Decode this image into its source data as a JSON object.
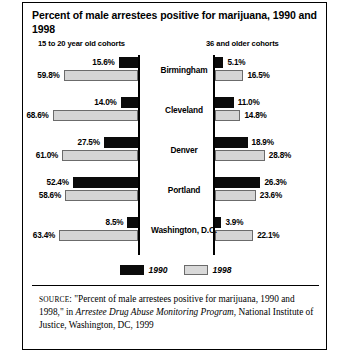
{
  "figure": {
    "title": "Percent of male arrestees positive for marijuana, 1990 and 1998",
    "left_header": "15 to 20 year old cohorts",
    "right_header": "36 and older cohorts",
    "legend": [
      {
        "label": "1990",
        "color": "#0b0b0b"
      },
      {
        "label": "1998",
        "color": "#d5d5d5"
      }
    ],
    "source_prefix": "SOURCE",
    "source_part1": ": \"Percent of male arrestees positive for marijuana, 1990 and 1998,\" in ",
    "source_italic": "Arrestee Drug Abuse Monitoring Program",
    "source_part2": ", National Institute of Justice, Washington, DC, 1999"
  },
  "chart_data": {
    "type": "bar",
    "title": "Percent of male arrestees positive for marijuana, 1990 and 1998",
    "orientation": "horizontal",
    "panels": [
      {
        "name": "15 to 20 year old cohorts",
        "direction": "left",
        "max": 70,
        "series": [
          {
            "name": "1990",
            "values": [
              15.6,
              14.0,
              27.5,
              52.4,
              8.5
            ]
          },
          {
            "name": "1998",
            "values": [
              59.8,
              68.6,
              61.0,
              58.6,
              63.4
            ]
          }
        ],
        "labels": {
          "1990": [
            "15.6%",
            "14.0%",
            "27.5%",
            "52.4%",
            "8.5%"
          ],
          "1998": [
            "59.8%",
            "68.6%",
            "61.0%",
            "58.6%",
            "63.4%"
          ]
        }
      },
      {
        "name": "36 and older cohorts",
        "direction": "right",
        "max": 70,
        "series": [
          {
            "name": "1990",
            "values": [
              5.1,
              11.0,
              18.9,
              26.3,
              3.9
            ]
          },
          {
            "name": "1998",
            "values": [
              16.5,
              14.8,
              28.8,
              23.6,
              22.1
            ]
          }
        ],
        "labels": {
          "1990": [
            "5.1%",
            "11.0%",
            "18.9%",
            "26.3%",
            "3.9%"
          ],
          "1998": [
            "16.5%",
            "14.8%",
            "28.8%",
            "23.6%",
            "22.1%"
          ]
        }
      }
    ],
    "categories": [
      "Birmingham",
      "Cleveland",
      "Denver",
      "Portland",
      "Washington, D.C."
    ],
    "ylabel": "",
    "xlabel": "",
    "grid": false,
    "legend_position": "bottom-center"
  }
}
